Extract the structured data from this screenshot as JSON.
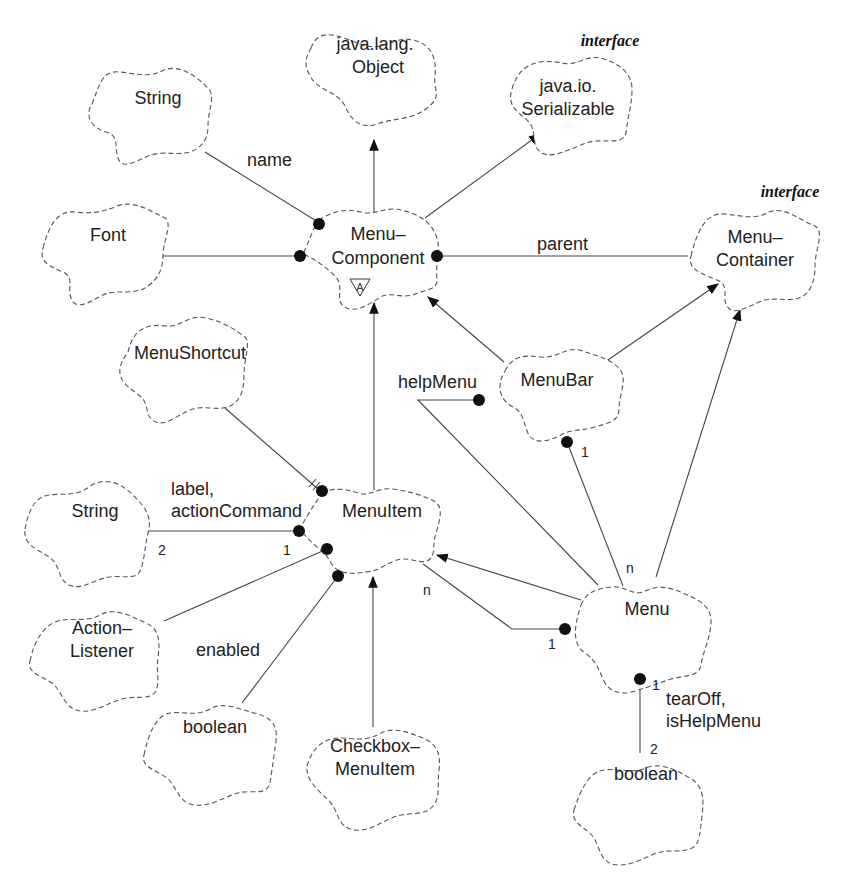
{
  "diagram": {
    "classes": [
      {
        "id": "object",
        "lines": [
          "java.lang.",
          "Object"
        ],
        "cx": 375,
        "cy": 58,
        "stereotype": null
      },
      {
        "id": "serializable",
        "lines": [
          "java.io.",
          "Serializable"
        ],
        "cx": 572,
        "cy": 98,
        "stereotype": "interface"
      },
      {
        "id": "string-name",
        "lines": [
          "String"
        ],
        "cx": 150,
        "cy": 100,
        "stereotype": null
      },
      {
        "id": "font",
        "lines": [
          "Font"
        ],
        "cx": 105,
        "cy": 235,
        "stereotype": null
      },
      {
        "id": "menu-component",
        "lines": [
          "Menu–",
          "Component"
        ],
        "cx": 375,
        "cy": 250,
        "stereotype": null,
        "abstract": true
      },
      {
        "id": "menu-container",
        "lines": [
          "Menu–",
          "Container"
        ],
        "cx": 755,
        "cy": 250,
        "stereotype": "interface"
      },
      {
        "id": "menu-shortcut",
        "lines": [
          "MenuShortcut"
        ],
        "cx": 180,
        "cy": 360,
        "stereotype": null
      },
      {
        "id": "menu-bar",
        "lines": [
          "MenuBar"
        ],
        "cx": 565,
        "cy": 385,
        "stereotype": null
      },
      {
        "id": "string-label",
        "lines": [
          "String"
        ],
        "cx": 95,
        "cy": 515,
        "stereotype": null
      },
      {
        "id": "menu-item",
        "lines": [
          "MenuItem"
        ],
        "cx": 380,
        "cy": 515,
        "stereotype": null
      },
      {
        "id": "action-listener",
        "lines": [
          "Action–",
          "Listener"
        ],
        "cx": 100,
        "cy": 645,
        "stereotype": null
      },
      {
        "id": "boolean-enabled",
        "lines": [
          "boolean"
        ],
        "cx": 210,
        "cy": 735,
        "stereotype": null
      },
      {
        "id": "checkbox-menu-item",
        "lines": [
          "Checkbox–",
          "MenuItem"
        ],
        "cx": 375,
        "cy": 760,
        "stereotype": null
      },
      {
        "id": "menu",
        "lines": [
          "Menu"
        ],
        "cx": 645,
        "cy": 625,
        "stereotype": null
      },
      {
        "id": "boolean-menu",
        "lines": [
          "boolean"
        ],
        "cx": 640,
        "cy": 800,
        "stereotype": null
      }
    ],
    "relationships": [
      {
        "type": "inheritance",
        "from": "menu-component",
        "to": "object"
      },
      {
        "type": "inheritance",
        "from": "menu-component",
        "to": "serializable"
      },
      {
        "type": "association",
        "owner": "menu-component",
        "target": "string-name",
        "role": "name"
      },
      {
        "type": "association",
        "owner": "menu-component",
        "target": "font",
        "role": ""
      },
      {
        "type": "association",
        "owner": "menu-component",
        "target": "menu-container",
        "role": "parent"
      },
      {
        "type": "inheritance",
        "from": "menu-bar",
        "to": "menu-component"
      },
      {
        "type": "inheritance",
        "from": "menu-bar",
        "to": "menu-container"
      },
      {
        "type": "inheritance",
        "from": "menu-item",
        "to": "menu-component"
      },
      {
        "type": "association",
        "owner": "menu-bar",
        "target": "menu",
        "role": "helpMenu"
      },
      {
        "type": "association",
        "owner": "menu-bar",
        "target": "menu",
        "role": "",
        "owner_mult": "1",
        "target_mult": "n"
      },
      {
        "type": "inheritance",
        "from": "menu",
        "to": "menu-container"
      },
      {
        "type": "association",
        "owner": "menu-item",
        "target": "menu-shortcut",
        "role": "",
        "physical_containment": true
      },
      {
        "type": "association",
        "owner": "menu-item",
        "target": "string-label",
        "role": "label, actionCommand",
        "owner_mult": "1",
        "target_mult": "2"
      },
      {
        "type": "association",
        "owner": "menu-item",
        "target": "action-listener",
        "role": ""
      },
      {
        "type": "association",
        "owner": "menu-item",
        "target": "boolean-enabled",
        "role": "enabled"
      },
      {
        "type": "inheritance",
        "from": "checkbox-menu-item",
        "to": "menu-item"
      },
      {
        "type": "inheritance",
        "from": "menu",
        "to": "menu-item"
      },
      {
        "type": "association",
        "owner": "menu",
        "target": "menu-item",
        "role": "",
        "owner_mult": "1",
        "target_mult": "n"
      },
      {
        "type": "association",
        "owner": "menu",
        "target": "boolean-menu",
        "role": "tearOff, isHelpMenu",
        "owner_mult": "1",
        "target_mult": "2"
      }
    ],
    "labels": {
      "stereotype_serializable": "interface",
      "stereotype_menu_container": "interface",
      "role_name": "name",
      "role_parent": "parent",
      "role_help_menu": "helpMenu",
      "role_label_1": "label,",
      "role_label_2": "actionCommand",
      "role_enabled": "enabled",
      "role_tearoff_1": "tearOff,",
      "role_tearoff_2": "isHelpMenu",
      "abstract_marker": "A",
      "mult_string_label_owner": "1",
      "mult_string_label_target": "2",
      "mult_menubar_owner": "1",
      "mult_menubar_target": "n",
      "mult_menu_items_owner": "1",
      "mult_menu_items_target": "n",
      "mult_tearoff_owner": "1",
      "mult_tearoff_target": "2"
    },
    "class_names": {
      "object_1": "java.lang.",
      "object_2": "Object",
      "serializable_1": "java.io.",
      "serializable_2": "Serializable",
      "string_name": "String",
      "font": "Font",
      "menu_component_1": "Menu–",
      "menu_component_2": "Component",
      "menu_container_1": "Menu–",
      "menu_container_2": "Container",
      "menu_shortcut": "MenuShortcut",
      "menu_bar": "MenuBar",
      "string_label": "String",
      "menu_item": "MenuItem",
      "action_listener_1": "Action–",
      "action_listener_2": "Listener",
      "boolean_enabled": "boolean",
      "checkbox_menu_item_1": "Checkbox–",
      "checkbox_menu_item_2": "MenuItem",
      "menu": "Menu",
      "boolean_menu": "boolean"
    }
  }
}
